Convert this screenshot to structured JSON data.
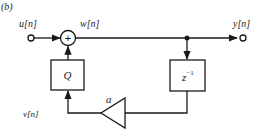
{
  "figure": {
    "panel_label": "(b)"
  },
  "signals": {
    "input": "u[n]",
    "adder_out": "w[n]",
    "output": "y[n]",
    "quantizer_in": "v[n]"
  },
  "blocks": {
    "adder": "+",
    "quantizer": "Q",
    "delay_base": "z",
    "delay_exp": "−1",
    "gain": "a"
  }
}
